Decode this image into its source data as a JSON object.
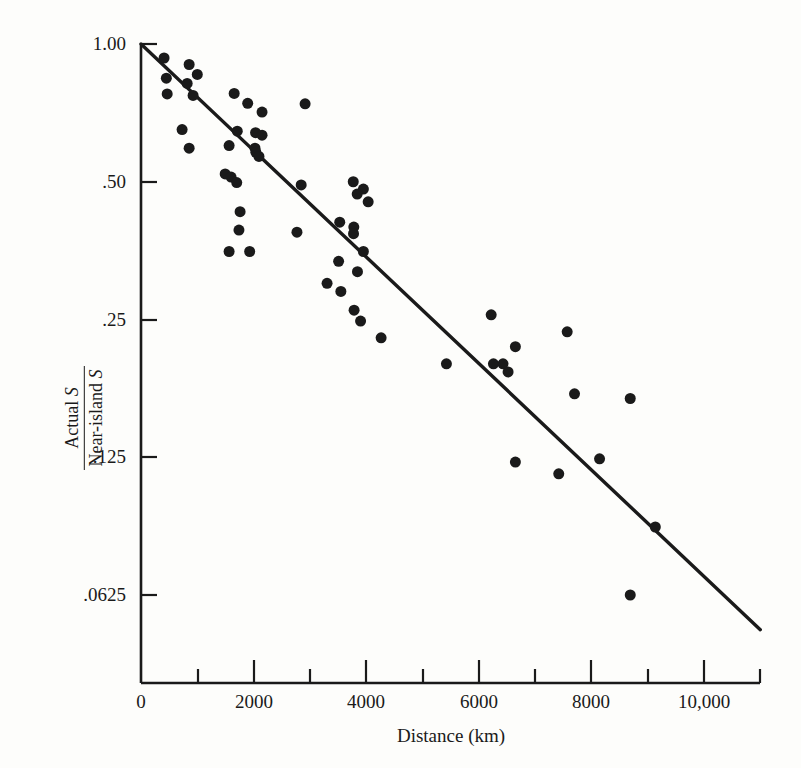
{
  "figure": {
    "background_color": "#fdfdfb",
    "ink_color": "#1a1a1a"
  },
  "axes": {
    "x_title": "Distance (km)",
    "y_title_numerator": "Actual",
    "y_title_numerator_symbol": "S",
    "y_title_denominator": "Near-island",
    "y_title_denominator_symbol": "S",
    "x_tick_labels": [
      "0",
      "2000",
      "4000",
      "6000",
      "8000",
      "10,000"
    ],
    "y_tick_labels": [
      "1.00",
      ".50",
      ".25",
      ".125",
      ".0625"
    ]
  },
  "chart_data": {
    "type": "scatter",
    "title": "",
    "xlabel": "Distance (km)",
    "ylabel": "Actual S / Near-island S",
    "xlim": [
      0,
      11000
    ],
    "ylim": [
      0.05,
      1.0
    ],
    "yscale": "log2",
    "grid": false,
    "legend": null,
    "x_ticks": [
      0,
      2000,
      4000,
      6000,
      8000,
      10000
    ],
    "x_minor_ticks": [
      1000,
      3000,
      5000,
      7000,
      9000,
      11000
    ],
    "y_ticks": [
      1.0,
      0.5,
      0.25,
      0.125,
      0.0625
    ],
    "marker": {
      "shape": "circle",
      "color": "#1a1a1a",
      "size_px": 11
    },
    "series": [
      {
        "name": "Island data",
        "x": [
          410,
          855,
          1000,
          450,
          820,
          465,
          925,
          1655,
          1895,
          2150,
          2915,
          730,
          855,
          1710,
          2035,
          2150,
          1565,
          2025,
          2040,
          2095,
          1495,
          1600,
          1700,
          2845,
          3770,
          3950,
          1565,
          1930,
          3840,
          4035,
          1760,
          1740,
          2770,
          3530,
          3780,
          3775,
          3950,
          3510,
          3845,
          3305,
          3550,
          3785,
          3900,
          4265,
          5425,
          6430,
          6650,
          7570,
          7700,
          6220,
          6650,
          7420,
          8145,
          8690,
          9135,
          8690,
          6520,
          6260
        ],
        "y": [
          0.932,
          0.902,
          0.858,
          0.842,
          0.82,
          0.778,
          0.772,
          0.78,
          0.742,
          0.71,
          0.74,
          0.65,
          0.592,
          0.645,
          0.64,
          0.632,
          0.6,
          0.592,
          0.58,
          0.568,
          0.52,
          0.512,
          0.498,
          0.492,
          0.5,
          0.482,
          0.352,
          0.352,
          0.47,
          0.452,
          0.43,
          0.392,
          0.388,
          0.408,
          0.398,
          0.385,
          0.352,
          0.335,
          0.318,
          0.3,
          0.288,
          0.262,
          0.248,
          0.228,
          0.2,
          0.2,
          0.218,
          0.235,
          0.172,
          0.256,
          0.122,
          0.115,
          0.124,
          0.0625,
          0.088,
          0.168,
          0.192,
          0.2
        ]
      }
    ],
    "trend_line": {
      "type": "linear-on-log",
      "x_start": 0,
      "y_start": 1.0,
      "x_end": 11000,
      "y_end": 0.0525
    }
  }
}
